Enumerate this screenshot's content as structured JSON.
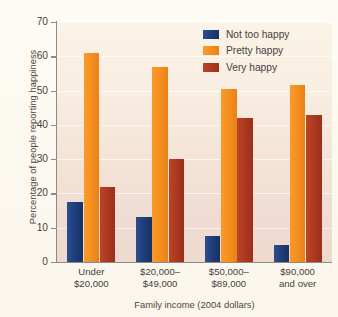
{
  "chart_data": {
    "type": "bar",
    "title": "",
    "xlabel": "Family income (2004 dollars)",
    "ylabel": "Percentage of people reporting happiness",
    "categories": [
      "Under\n$20,000",
      "$20,000–\n$49,000",
      "$50,000–\n$89,000",
      "$90,000\nand over"
    ],
    "category_lines": [
      [
        "Under",
        "$20,000"
      ],
      [
        "$20,000–",
        "$49,000"
      ],
      [
        "$50,000–",
        "$89,000"
      ],
      [
        "$90,000",
        "and over"
      ]
    ],
    "series": [
      {
        "name": "Not too happy",
        "color": "#1f3c7a",
        "values": [
          17.5,
          13.0,
          7.5,
          5.0
        ]
      },
      {
        "name": "Pretty happy",
        "color": "#f5901e",
        "values": [
          61.0,
          57.0,
          50.5,
          51.5
        ]
      },
      {
        "name": "Very happy",
        "color": "#ae3a21",
        "values": [
          22.0,
          30.0,
          42.0,
          43.0
        ]
      }
    ],
    "ylim": [
      0,
      70
    ],
    "yticks": [
      0,
      10,
      20,
      30,
      40,
      50,
      60,
      70
    ],
    "ytick_labels": [
      "0",
      "10",
      "20",
      "30",
      "40",
      "50",
      "60",
      "70"
    ],
    "grid": true,
    "grid_axis": "y",
    "legend_position": "top-right",
    "plot_background": "#f4e4d6",
    "figure_background": "#fdfaf2"
  }
}
